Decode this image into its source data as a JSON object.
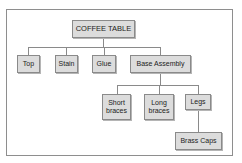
{
  "diagram": {
    "type": "hierarchy",
    "root": "COFFEE TABLE",
    "nodes": {
      "coffee_table": "COFFEE TABLE",
      "top": "Top",
      "stain": "Stain",
      "glue": "Glue",
      "base_assembly": "Base Assembly",
      "short_braces_line1": "Short",
      "short_braces_line2": "braces",
      "long_braces_line1": "Long",
      "long_braces_line2": "braces",
      "legs": "Legs",
      "brass_caps": "Brass Caps"
    },
    "edges": [
      [
        "COFFEE TABLE",
        "Top"
      ],
      [
        "COFFEE TABLE",
        "Stain"
      ],
      [
        "COFFEE TABLE",
        "Glue"
      ],
      [
        "COFFEE TABLE",
        "Base Assembly"
      ],
      [
        "Base Assembly",
        "Short braces"
      ],
      [
        "Base Assembly",
        "Long braces"
      ],
      [
        "Base Assembly",
        "Legs"
      ],
      [
        "Legs",
        "Brass Caps"
      ]
    ]
  }
}
